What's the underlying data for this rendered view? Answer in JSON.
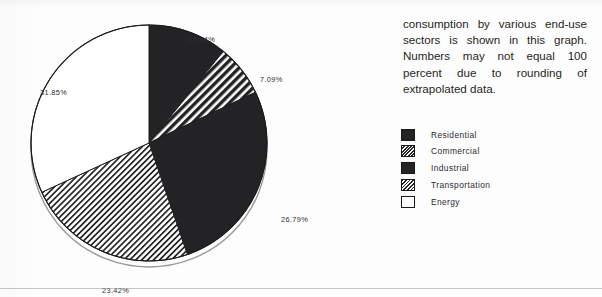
{
  "document": {
    "body_paragraph": "consumption by various end-use sectors is shown in this graph. Numbers may not equal 100 percent due to rounding of extrapolated data."
  },
  "legend": {
    "items": [
      {
        "label": "Residential",
        "pattern": "solid-black",
        "swatch_class": "sw-solid"
      },
      {
        "label": "Commercial",
        "pattern": "dense-hatch",
        "swatch_class": "sw-hatch-dense"
      },
      {
        "label": "Industrial",
        "pattern": "solid-black",
        "swatch_class": "sw-solid"
      },
      {
        "label": "Transportation",
        "pattern": "light-hatch",
        "swatch_class": "sw-hatch-light"
      },
      {
        "label": "Energy",
        "pattern": "white-empty",
        "swatch_class": "sw-empty"
      }
    ]
  },
  "chart_data": {
    "type": "pie",
    "title": "",
    "subtitle": "",
    "xlabel": "",
    "ylabel": "",
    "grid": false,
    "legend_position": "right",
    "start_angle_deg": 0,
    "direction": "clockwise",
    "units": "percent",
    "categories": [
      "Residential",
      "Commercial",
      "Industrial",
      "Transportation",
      "Energy"
    ],
    "values": [
      10.84,
      7.09,
      26.79,
      23.42,
      31.85
    ],
    "labels": [
      "10.84%",
      "7.09%",
      "26.79%",
      "23.42%",
      "31.85%"
    ],
    "total": 99.99,
    "slices": [
      {
        "name": "Residential",
        "value": 10.84,
        "label": "10.84%",
        "fill": "solid-black",
        "color": "#232325"
      },
      {
        "name": "Commercial",
        "value": 7.09,
        "label": "7.09%",
        "fill": "dense-hatch",
        "color": "#2a2a2c"
      },
      {
        "name": "Industrial",
        "value": 26.79,
        "label": "26.79%",
        "fill": "solid-black",
        "color": "#232325"
      },
      {
        "name": "Transportation",
        "value": 23.42,
        "label": "23.42%",
        "fill": "light-hatch",
        "color": "#262628"
      },
      {
        "name": "Energy",
        "value": 31.85,
        "label": "31.85%",
        "fill": "white-empty",
        "color": "#ffffff"
      }
    ],
    "annotations": [
      "Numbers may not equal 100 percent due to rounding of extrapolated data."
    ]
  }
}
